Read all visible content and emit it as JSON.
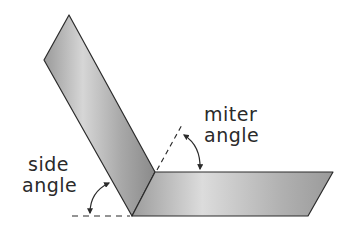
{
  "diagram": {
    "labels": {
      "miter": {
        "line1": "miter",
        "line2": "angle"
      },
      "side": {
        "line1": "side",
        "line2": "angle"
      }
    },
    "colors": {
      "outline": "#2b2b2b",
      "bar_dark": "#8f8f8f",
      "bar_light": "#d9d9d9",
      "text": "#2a2a2a",
      "background": "#ffffff"
    },
    "shapes": {
      "upright_bar": {
        "points": [
          [
            69,
            15
          ],
          [
            44,
            60
          ],
          [
            132,
            216
          ],
          [
            155,
            172
          ]
        ]
      },
      "base_bar": {
        "points": [
          [
            155,
            172
          ],
          [
            333,
            172
          ],
          [
            308,
            216
          ],
          [
            132,
            216
          ]
        ]
      },
      "miter_reference_line": {
        "from": [
          157,
          170
        ],
        "to": [
          183,
          123
        ],
        "style": "dashed"
      },
      "side_reference_line": {
        "from": [
          72,
          216
        ],
        "to": [
          130,
          216
        ],
        "style": "dashed"
      }
    }
  }
}
